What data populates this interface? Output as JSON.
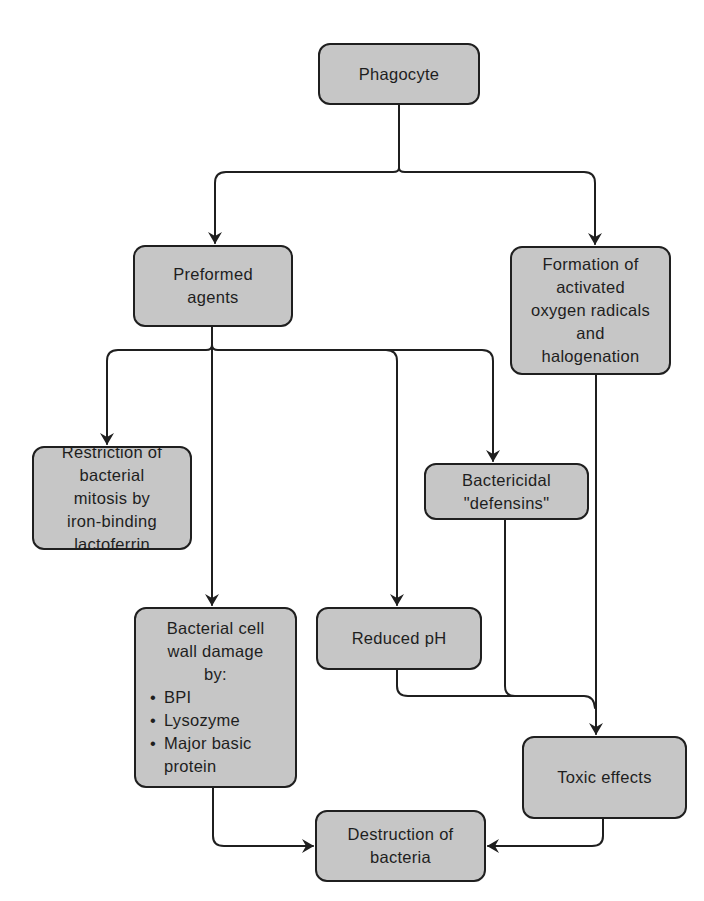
{
  "diagram": {
    "type": "flowchart",
    "colors": {
      "node_fill": "#c6c6c6",
      "node_border": "#1f1f1f",
      "edge": "#1f1f1f",
      "text": "#1e1e1e",
      "background": "#ffffff"
    },
    "nodes": {
      "phagocyte": {
        "lines": [
          "Phagocyte"
        ]
      },
      "preformed_agents": {
        "lines": [
          "Preformed",
          "agents"
        ]
      },
      "oxygen_radicals": {
        "lines": [
          "Formation of",
          "activated",
          "oxygen radicals",
          "and",
          "halogenation"
        ]
      },
      "lactoferrin": {
        "lines": [
          "Restriction of",
          "bacterial",
          "mitosis by",
          "iron-binding",
          "lactoferrin"
        ]
      },
      "defensins": {
        "lines": [
          "Bactericidal",
          "\"defensins\""
        ]
      },
      "cell_wall_damage": {
        "lines": [
          "Bacterial cell",
          "wall damage",
          "by:"
        ],
        "bullet_symbol": "•",
        "bullets": [
          "BPI",
          "Lysozyme",
          "Major basic"
        ],
        "bullet_continuation": "protein"
      },
      "reduced_ph": {
        "lines": [
          "Reduced pH"
        ]
      },
      "toxic_effects": {
        "lines": [
          "Toxic effects"
        ]
      },
      "destruction": {
        "lines": [
          "Destruction of",
          "bacteria"
        ]
      }
    },
    "edges": [
      {
        "from": "Phagocyte",
        "to": "Preformed agents"
      },
      {
        "from": "Phagocyte",
        "to": "Formation of activated oxygen radicals and halogenation"
      },
      {
        "from": "Preformed agents",
        "to": "Restriction of bacterial mitosis by iron-binding lactoferrin"
      },
      {
        "from": "Preformed agents",
        "to": "Bacterial cell wall damage"
      },
      {
        "from": "Preformed agents",
        "to": "Reduced pH"
      },
      {
        "from": "Preformed agents",
        "to": "Bactericidal \"defensins\""
      },
      {
        "from": "Formation of activated oxygen radicals and halogenation",
        "to": "Toxic effects"
      },
      {
        "from": "Reduced pH",
        "to": "Toxic effects"
      },
      {
        "from": "Bactericidal \"defensins\"",
        "to": "Toxic effects"
      },
      {
        "from": "Bacterial cell wall damage",
        "to": "Destruction of bacteria"
      },
      {
        "from": "Toxic effects",
        "to": "Destruction of bacteria"
      }
    ]
  }
}
